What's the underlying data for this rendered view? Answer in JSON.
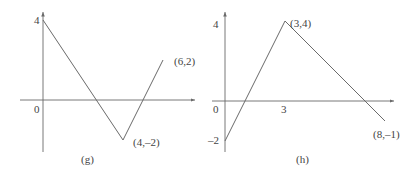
{
  "chart_data": [
    {
      "type": "line",
      "caption": "(g)",
      "points": [
        [
          0,
          4
        ],
        [
          4,
          -2
        ],
        [
          6,
          2
        ]
      ],
      "annotations": [
        {
          "text": "(6,2)",
          "x": 6,
          "y": 2
        },
        {
          "text": "(4,–2)",
          "x": 4,
          "y": -2
        }
      ],
      "y_tick_labels": [
        {
          "value": 4,
          "text": "4"
        }
      ],
      "origin_label": "0",
      "xlim": [
        -1.1,
        7.6
      ],
      "ylim": [
        -2.6,
        4.4
      ],
      "grid": false
    },
    {
      "type": "line",
      "caption": "(h)",
      "points": [
        [
          0,
          -2
        ],
        [
          3,
          4
        ],
        [
          8,
          -1
        ]
      ],
      "annotations": [
        {
          "text": "(3,4)",
          "x": 3,
          "y": 4
        },
        {
          "text": "(8,–1)",
          "x": 8,
          "y": -1
        }
      ],
      "y_tick_labels": [
        {
          "value": 4,
          "text": "4"
        },
        {
          "value": -2,
          "text": "–2"
        }
      ],
      "x_tick_labels": [
        {
          "value": 3,
          "text": "3"
        }
      ],
      "origin_label": "0",
      "xlim": [
        -0.5,
        8.4
      ],
      "ylim": [
        -2.6,
        4.4
      ],
      "grid": false
    }
  ]
}
